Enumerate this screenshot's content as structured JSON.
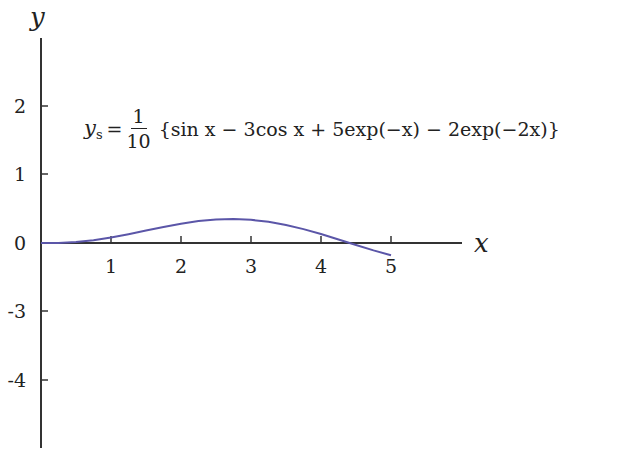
{
  "chart_data": {
    "type": "line",
    "title": "",
    "xlabel": "x",
    "ylabel": "y",
    "x_ticks": [
      "1",
      "2",
      "3",
      "4",
      "5"
    ],
    "y_ticks": [
      "2",
      "1",
      "0",
      "-3",
      "-4"
    ],
    "annotation": {
      "lhs": "y",
      "lhs_sub": "s",
      "equals": "=",
      "frac_num": "1",
      "frac_den": "10",
      "body": "{sin x − 3cos x + 5exp(−x) − 2exp(−2x)}"
    },
    "series": [
      {
        "name": "y_s",
        "color": "#5b56a8",
        "x": [
          0,
          0.25,
          0.5,
          0.75,
          1,
          1.25,
          1.5,
          1.75,
          2,
          2.25,
          2.5,
          2.75,
          3,
          3.25,
          3.5,
          3.75,
          4,
          4.25,
          4.5,
          4.75,
          5
        ],
        "y": [
          0,
          0.002,
          0.014,
          0.04,
          0.079,
          0.127,
          0.18,
          0.233,
          0.28,
          0.317,
          0.34,
          0.347,
          0.336,
          0.307,
          0.261,
          0.201,
          0.13,
          0.051,
          -0.029,
          -0.107,
          -0.178
        ]
      }
    ],
    "grid": false,
    "legend": "none",
    "xlim": [
      0,
      6
    ],
    "ylim": [
      -4.8,
      2.9
    ]
  }
}
